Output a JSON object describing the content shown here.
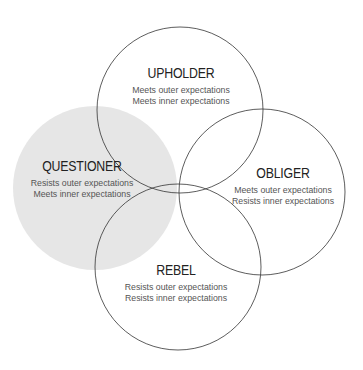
{
  "diagram": {
    "type": "venn",
    "colors": {
      "stroke": "#333333",
      "highlight_fill": "#e6e6e6",
      "title": "#222222",
      "desc": "#555555"
    },
    "circles": [
      {
        "id": "upholder",
        "title": "UPHOLDER",
        "line1": "Meets outer expectations",
        "line2": "Meets inner expectations",
        "highlighted": false
      },
      {
        "id": "questioner",
        "title": "QUESTIONER",
        "line1": "Resists outer expectations",
        "line2": "Meets inner expectations",
        "highlighted": true
      },
      {
        "id": "obliger",
        "title": "OBLIGER",
        "line1": "Meets outer expectations",
        "line2": "Resists inner expectations",
        "highlighted": false
      },
      {
        "id": "rebel",
        "title": "REBEL",
        "line1": "Resists outer expectations",
        "line2": "Resists inner expectations",
        "highlighted": false
      }
    ]
  }
}
